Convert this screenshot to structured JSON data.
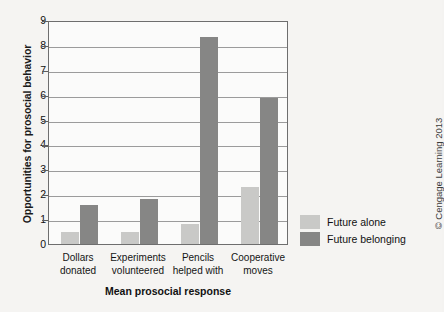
{
  "figure": {
    "background_color": "#f5f4f2",
    "plot_background_color": "#fbfbfa",
    "frame_color": "#6e6e6e",
    "gridline_color": "#9b9b9b"
  },
  "credit": {
    "text": "© Cengage Learning 2013"
  },
  "legend": {
    "position": "right",
    "entries": [
      {
        "label": "Future alone",
        "color": "#c9c9c7"
      },
      {
        "label": "Future belonging",
        "color": "#868685"
      }
    ]
  },
  "chart_data": {
    "type": "bar",
    "title": "",
    "subtitle": "",
    "xlabel": "Mean prosocial response",
    "ylabel": "Opportunities for prosocial behavior",
    "categories": [
      "Dollars\ndonated",
      "Experiments\nvolunteered",
      "Pencils\nhelped with",
      "Cooperative\nmoves"
    ],
    "category_lines": [
      [
        "Dollars",
        "donated"
      ],
      [
        "Experiments",
        "volunteered"
      ],
      [
        "Pencils",
        "helped with"
      ],
      [
        "Cooperative",
        "moves"
      ]
    ],
    "series": [
      {
        "name": "Future alone",
        "color": "#c9c9c7",
        "values": [
          0.5,
          0.5,
          0.8,
          2.3
        ]
      },
      {
        "name": "Future belonging",
        "color": "#868685",
        "values": [
          1.55,
          1.8,
          8.3,
          5.85
        ]
      }
    ],
    "ylim": [
      0,
      9
    ],
    "ytick_step": 1,
    "yticks": [
      0,
      1,
      2,
      3,
      4,
      5,
      6,
      7,
      8,
      9
    ],
    "grid": true,
    "grid_axis": "y",
    "legend_position": "right"
  }
}
